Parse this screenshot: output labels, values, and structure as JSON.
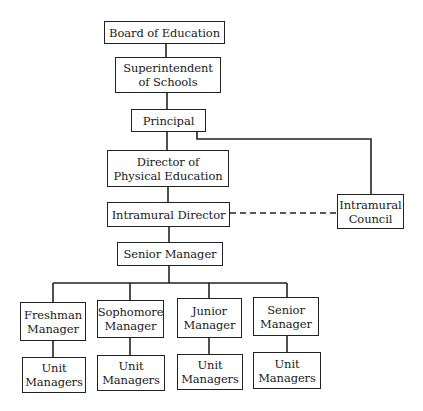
{
  "chart": {
    "type": "organization-chart",
    "nodes": {
      "board": {
        "label": "Board of Education"
      },
      "superintendent": {
        "label": "Superintendent\nof Schools"
      },
      "principal": {
        "label": "Principal"
      },
      "director_pe": {
        "label": "Director of\nPhysical Education"
      },
      "intramural_director": {
        "label": "Intramural Director"
      },
      "intramural_council": {
        "label": "Intramural\nCouncil"
      },
      "senior_manager": {
        "label": "Senior Manager"
      },
      "class_managers": [
        {
          "label": "Freshman\nManager"
        },
        {
          "label": "Sophomore\nManager"
        },
        {
          "label": "Junior\nManager"
        },
        {
          "label": "Senior\nManager"
        }
      ],
      "unit_managers": [
        {
          "label": "Unit\nManagers"
        },
        {
          "label": "Unit\nManagers"
        },
        {
          "label": "Unit\nManagers"
        },
        {
          "label": "Unit\nManagers"
        }
      ]
    },
    "edges": [
      {
        "from": "board",
        "to": "superintendent",
        "style": "solid"
      },
      {
        "from": "superintendent",
        "to": "principal",
        "style": "solid"
      },
      {
        "from": "principal",
        "to": "director_pe",
        "style": "solid"
      },
      {
        "from": "principal",
        "to": "intramural_council",
        "style": "solid"
      },
      {
        "from": "director_pe",
        "to": "intramural_director",
        "style": "solid"
      },
      {
        "from": "intramural_director",
        "to": "intramural_council",
        "style": "dashed"
      },
      {
        "from": "intramural_director",
        "to": "senior_manager",
        "style": "solid"
      },
      {
        "from": "senior_manager",
        "to": "class_managers",
        "style": "solid"
      },
      {
        "from": "class_managers",
        "to": "unit_managers",
        "style": "solid"
      }
    ]
  },
  "colors": {
    "line": "#222222",
    "background": "#ffffff"
  }
}
